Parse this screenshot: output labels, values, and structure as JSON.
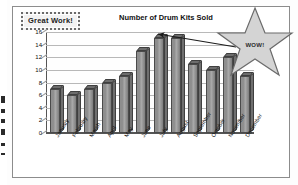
{
  "worksheet": {
    "stamp_label": "Great Work!",
    "star_label": "WOW!"
  },
  "chart_data": {
    "type": "bar",
    "title": "Number of Drum Kits Sold",
    "xlabel": "",
    "ylabel": "",
    "categories": [
      "January",
      "February",
      "March",
      "April",
      "May",
      "June",
      "July",
      "August",
      "September",
      "October",
      "November",
      "December"
    ],
    "values": [
      7,
      6,
      7,
      8,
      9,
      13,
      15,
      15,
      11,
      10,
      12,
      9
    ],
    "ylim": [
      0,
      16
    ],
    "yticks": [
      0,
      2,
      4,
      6,
      8,
      10,
      12,
      14,
      16
    ],
    "ytick_labels": [
      "0",
      "2",
      "4",
      "6",
      "8",
      "10",
      "12",
      "14",
      "16"
    ],
    "grid": true,
    "legend": false,
    "style": "3d-column",
    "bar_color": "#8e8e8e",
    "annotations": [
      {
        "text": "WOW!",
        "target_category": "August",
        "type": "star-callout-with-arrow"
      },
      {
        "text": "Great Work!",
        "type": "stamp"
      }
    ]
  }
}
